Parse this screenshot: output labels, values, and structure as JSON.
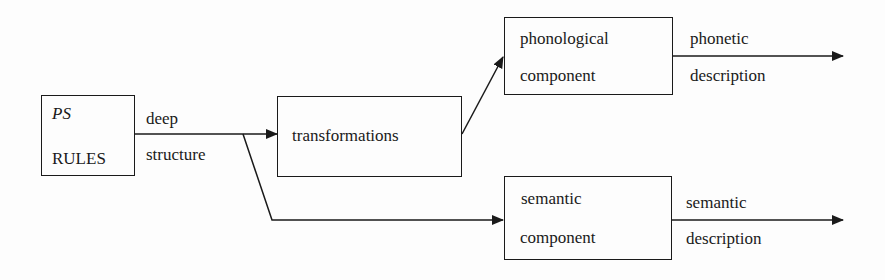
{
  "diagram": {
    "nodes": {
      "ps_rules": {
        "line1": "PS",
        "line2": "RULES"
      },
      "transformations": {
        "label": "transformations"
      },
      "phonological": {
        "line1": "phonological",
        "line2": "component"
      },
      "semantic": {
        "line1": "semantic",
        "line2": "component"
      }
    },
    "edges": {
      "deep_structure": {
        "line1": "deep",
        "line2": "structure"
      },
      "phonetic_description": {
        "line1": "phonetic",
        "line2": "description"
      },
      "semantic_description": {
        "line1": "semantic",
        "line2": "description"
      }
    },
    "colors": {
      "ink": "#1a1a1a",
      "background": "#fdfdfd"
    }
  }
}
